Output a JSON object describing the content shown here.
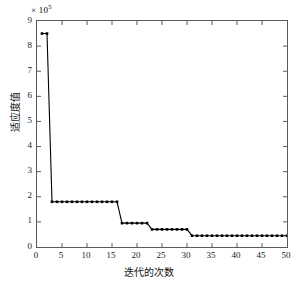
{
  "chart_data": {
    "type": "line",
    "title": "",
    "subtitle": "",
    "xlabel": "迭代的次数",
    "ylabel": "适应度值",
    "y_multiplier_label": "× 10",
    "y_multiplier_exponent": "5",
    "y_scale_factor": 100000,
    "xlim": [
      0,
      50
    ],
    "ylim": [
      0,
      9
    ],
    "xticks": [
      0,
      5,
      10,
      15,
      20,
      25,
      30,
      35,
      40,
      45,
      50
    ],
    "yticks": [
      0,
      1,
      2,
      3,
      4,
      5,
      6,
      7,
      8,
      9
    ],
    "grid": false,
    "legend": null,
    "marker": "square",
    "marker_color": "#000000",
    "line_color": "#000000",
    "axis_color": "#5a5a5a",
    "x": [
      1,
      2,
      3,
      4,
      5,
      6,
      7,
      8,
      9,
      10,
      11,
      12,
      13,
      14,
      15,
      16,
      17,
      18,
      19,
      20,
      21,
      22,
      23,
      24,
      25,
      26,
      27,
      28,
      29,
      30,
      31,
      32,
      33,
      34,
      35,
      36,
      37,
      38,
      39,
      40,
      41,
      42,
      43,
      44,
      45,
      46,
      47,
      48,
      49,
      50
    ],
    "values": [
      8.5,
      8.5,
      1.8,
      1.8,
      1.8,
      1.8,
      1.8,
      1.8,
      1.8,
      1.8,
      1.8,
      1.8,
      1.8,
      1.8,
      1.8,
      1.8,
      0.95,
      0.95,
      0.95,
      0.95,
      0.95,
      0.95,
      0.7,
      0.7,
      0.7,
      0.7,
      0.7,
      0.7,
      0.7,
      0.7,
      0.45,
      0.45,
      0.45,
      0.45,
      0.45,
      0.45,
      0.45,
      0.45,
      0.45,
      0.45,
      0.45,
      0.45,
      0.45,
      0.45,
      0.45,
      0.45,
      0.45,
      0.45,
      0.45,
      0.45
    ],
    "series": [
      {
        "name": "适应度值",
        "values": [
          8.5,
          8.5,
          1.8,
          1.8,
          1.8,
          1.8,
          1.8,
          1.8,
          1.8,
          1.8,
          1.8,
          1.8,
          1.8,
          1.8,
          1.8,
          1.8,
          0.95,
          0.95,
          0.95,
          0.95,
          0.95,
          0.95,
          0.7,
          0.7,
          0.7,
          0.7,
          0.7,
          0.7,
          0.7,
          0.7,
          0.45,
          0.45,
          0.45,
          0.45,
          0.45,
          0.45,
          0.45,
          0.45,
          0.45,
          0.45,
          0.45,
          0.45,
          0.45,
          0.45,
          0.45,
          0.45,
          0.45,
          0.45,
          0.45,
          0.45
        ]
      }
    ]
  }
}
